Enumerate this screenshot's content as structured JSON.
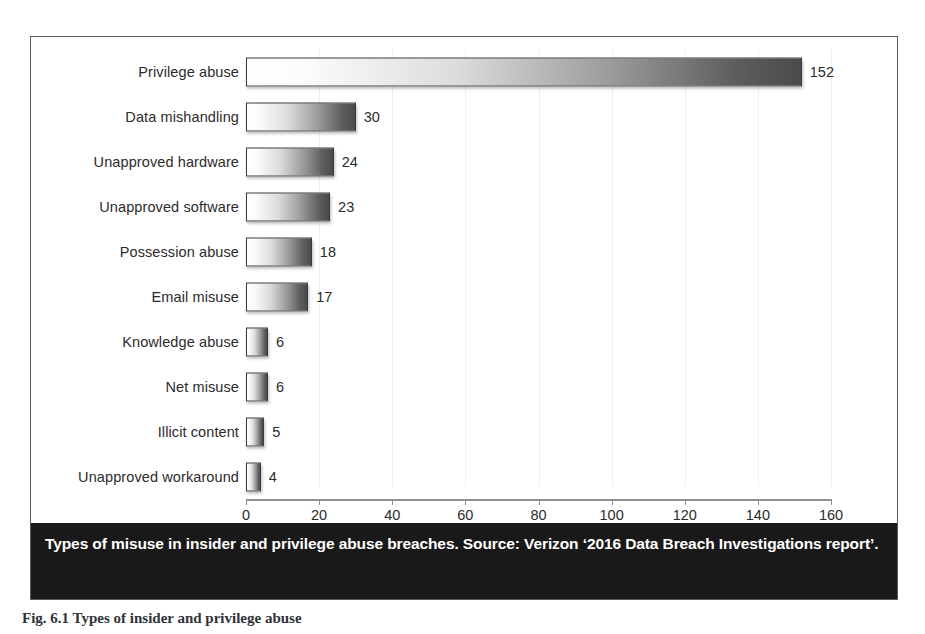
{
  "figure": {
    "caption_bar_text": "Types of misuse in insider and privilege abuse breaches. Source: Verizon ‘2016 Data Breach Investigations report’.",
    "caption_bar_bg": "#191919",
    "caption_bar_fg": "#ffffff",
    "below_caption_text": "Fig. 6.1 Types of insider and privilege abuse",
    "panel_border_color": "#5a5a5a"
  },
  "chart_data": {
    "type": "bar",
    "orientation": "horizontal",
    "title": "",
    "xlabel": "",
    "ylabel": "",
    "xlim": [
      0,
      160
    ],
    "xticks": [
      0,
      20,
      40,
      60,
      80,
      100,
      120,
      140,
      160
    ],
    "xtick_labels": [
      "0",
      "20",
      "40",
      "60",
      "80",
      "100",
      "120",
      "140",
      "160"
    ],
    "grid": true,
    "legend": false,
    "data_labels": true,
    "bar_gradient_from": "#ffffff",
    "bar_gradient_to": "#4a4a4a",
    "bar_border": "#3a3a3a",
    "categories": [
      "Privilege abuse",
      "Data mishandling",
      "Unapproved hardware",
      "Unapproved software",
      "Possession abuse",
      "Email misuse",
      "Knowledge abuse",
      "Net misuse",
      "Illicit content",
      "Unapproved workaround"
    ],
    "values": [
      152,
      30,
      24,
      23,
      18,
      17,
      6,
      6,
      5,
      4
    ],
    "value_labels": [
      "152",
      "30",
      "24",
      "23",
      "18",
      "17",
      "6",
      "6",
      "5",
      "4"
    ]
  }
}
